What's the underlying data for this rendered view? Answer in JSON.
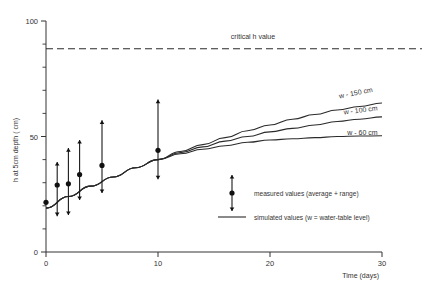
{
  "chart_data": {
    "type": "line",
    "title": "",
    "xlabel": "Time (days)",
    "ylabel": "h  at 5cm depth ( cm)",
    "xlim": [
      0,
      30
    ],
    "ylim": [
      0,
      100
    ],
    "xticks": [
      0,
      10,
      20,
      30
    ],
    "xtick_labels": [
      "0",
      "10",
      "20",
      "30"
    ],
    "yticks": [
      0,
      50,
      100
    ],
    "ytick_labels": [
      "0",
      "50",
      "100"
    ],
    "yticks_minor": [
      10,
      20,
      30,
      40,
      60,
      70,
      80,
      90
    ],
    "grid": false,
    "legend_position": "inside-lower-right",
    "annotations": [
      {
        "name": "critical-h-value",
        "text": "critical h value",
        "x": 16.5,
        "y": 92
      },
      {
        "name": "curve-label-w150",
        "text": "w - 150 cm",
        "x": 26.2,
        "y": 66.5
      },
      {
        "name": "curve-label-w100",
        "text": "w - 100 cm",
        "x": 26.6,
        "y": 59.5
      },
      {
        "name": "curve-label-w60",
        "text": "w - 60 cm",
        "x": 26.9,
        "y": 50.5
      }
    ],
    "critical_line": {
      "label": "critical h value",
      "y": 88,
      "style": "dashed"
    },
    "series": [
      {
        "name": "measured values (average + range)",
        "type": "scatter-errorbar",
        "marker": "filled-circle",
        "points": [
          {
            "x": 0.0,
            "y": 21.5,
            "low": 21.5,
            "high": 21.5
          },
          {
            "x": 1.0,
            "y": 29.0,
            "low": 15.5,
            "high": 39.0
          },
          {
            "x": 2.0,
            "y": 29.5,
            "low": 16.0,
            "high": 45.0
          },
          {
            "x": 3.0,
            "y": 33.5,
            "low": 22.5,
            "high": 48.5
          },
          {
            "x": 5.0,
            "y": 37.5,
            "low": 25.5,
            "high": 57.0
          },
          {
            "x": 10.0,
            "y": 44.0,
            "low": 31.5,
            "high": 66.0
          }
        ]
      },
      {
        "name": "simulated values (w = water-table level)",
        "type": "line",
        "curves": [
          {
            "label": "w - 150 cm",
            "x": [
              0,
              2,
              4,
              6,
              8,
              10,
              12,
              14,
              16,
              18,
              20,
              22,
              24,
              26,
              28,
              30
            ],
            "y": [
              19,
              24,
              28.5,
              32.5,
              36.5,
              40,
              43.5,
              46.5,
              49.5,
              52.5,
              55,
              57.5,
              59.5,
              61.5,
              63,
              64.5
            ]
          },
          {
            "label": "w - 100 cm",
            "x": [
              0,
              2,
              4,
              6,
              8,
              10,
              12,
              14,
              16,
              18,
              20,
              22,
              24,
              26,
              28,
              30
            ],
            "y": [
              19,
              24,
              28.5,
              32.5,
              36.5,
              40,
              43,
              45.5,
              48,
              50,
              52,
              53.5,
              55,
              56.5,
              57.5,
              58.5
            ]
          },
          {
            "label": "w - 60 cm",
            "x": [
              0,
              2,
              4,
              6,
              8,
              10,
              12,
              14,
              16,
              18,
              20,
              22,
              24,
              26,
              28,
              30
            ],
            "y": [
              19,
              24,
              28.5,
              32.5,
              36.5,
              40,
              42.5,
              44.5,
              46,
              47.5,
              48.5,
              49,
              49.5,
              50,
              50.2,
              50.3
            ]
          }
        ]
      }
    ],
    "legend": [
      {
        "name": "legend-measured",
        "marker": "errorbar-dot",
        "text": "measured values (average + range)"
      },
      {
        "name": "legend-simulated",
        "marker": "line",
        "text": "simulated values (w = water-table level)"
      }
    ]
  }
}
